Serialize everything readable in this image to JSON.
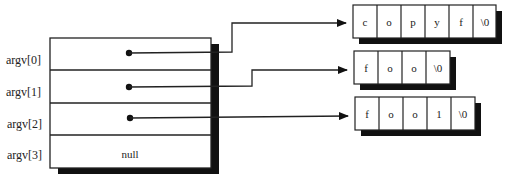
{
  "diagram": {
    "type": "argv pointer array",
    "array": {
      "rows": [
        {
          "label": "argv[0]",
          "content": "pointer",
          "points_to": 0
        },
        {
          "label": "argv[1]",
          "content": "pointer",
          "points_to": 1
        },
        {
          "label": "argv[2]",
          "content": "pointer",
          "points_to": 2
        },
        {
          "label": "argv[3]",
          "content": "null"
        }
      ]
    },
    "strings": [
      {
        "chars": [
          "c",
          "o",
          "p",
          "y",
          "f",
          "\\0"
        ]
      },
      {
        "chars": [
          "f",
          "o",
          "o",
          "\\0"
        ]
      },
      {
        "chars": [
          "f",
          "o",
          "o",
          "1",
          "\\0"
        ]
      }
    ],
    "colors": {
      "line": "#222222",
      "shadow": "#111111",
      "fill": "#ffffff"
    }
  }
}
